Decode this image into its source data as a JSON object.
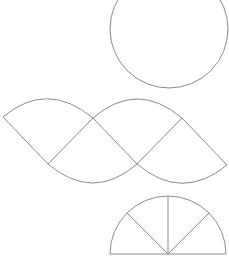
{
  "diagram": {
    "stroke_color": "#8a8a8a",
    "background": "#ffffff",
    "shapes": {
      "circle": {
        "cx": 169,
        "cy": 29,
        "r": 59
      },
      "sector_net": {
        "vertices": {
          "left": [
            3,
            117
          ],
          "top_mid": [
            93,
            118
          ],
          "top_right": [
            182,
            118
          ],
          "bottom_left": [
            48,
            164
          ],
          "bottom_mid": [
            137,
            164
          ],
          "right": [
            227,
            165
          ]
        }
      },
      "semicircle": {
        "cx": 168,
        "cy": 254,
        "r": 58,
        "divisions": 4
      }
    }
  }
}
